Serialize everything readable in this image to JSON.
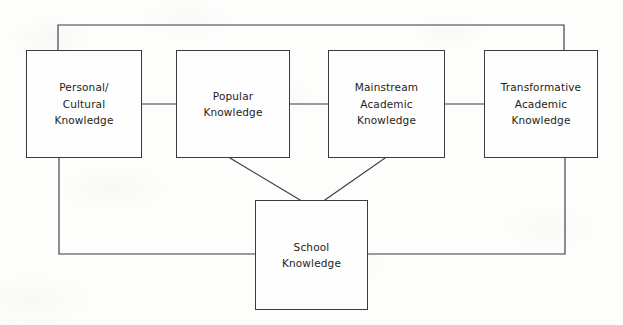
{
  "diagram": {
    "background_color": "#fdfdfc",
    "line_color": "#3b3b40",
    "text_color": "#1d1d20",
    "nodes": [
      {
        "id": "personal-cultural-knowledge",
        "lines": [
          "Personal/",
          "Cultural",
          "Knowledge"
        ],
        "x": 26,
        "y": 50,
        "width": 116,
        "height": 108
      },
      {
        "id": "popular-knowledge",
        "lines": [
          "Popular",
          "Knowledge"
        ],
        "x": 176,
        "y": 50,
        "width": 114,
        "height": 108
      },
      {
        "id": "mainstream-academic-knowledge",
        "lines": [
          "Mainstream",
          "Academic",
          "Knowledge"
        ],
        "x": 328,
        "y": 50,
        "width": 117,
        "height": 108
      },
      {
        "id": "transformative-academic-knowledge",
        "lines": [
          "Transformative",
          "Academic",
          "Knowledge"
        ],
        "x": 484,
        "y": 50,
        "width": 114,
        "height": 108
      },
      {
        "id": "school-knowledge",
        "lines": [
          "School",
          "Knowledge"
        ],
        "x": 255,
        "y": 200,
        "width": 113,
        "height": 110
      }
    ],
    "connectors": [
      {
        "id": "personal-to-popular-link",
        "type": "straight-horizontal",
        "points": "142,104 176,104"
      },
      {
        "id": "popular-to-mainstream-link",
        "type": "straight-horizontal",
        "points": "290,104 328,104"
      },
      {
        "id": "mainstream-to-transformative-link",
        "type": "straight-horizontal",
        "points": "445,104 484,104"
      },
      {
        "id": "popular-to-school-diagonal",
        "type": "diagonal",
        "points": "230,158 300,200"
      },
      {
        "id": "mainstream-to-school-diagonal",
        "type": "diagonal",
        "points": "385,158 325,200"
      },
      {
        "id": "personal-to-transformative-top-bracket",
        "type": "orthogonal",
        "points": "58,50 58,25 564,25 564,50"
      },
      {
        "id": "personal-to-school-bottom-left-bracket",
        "type": "orthogonal",
        "points": "59,158 59,254 255,254"
      },
      {
        "id": "transformative-to-school-bottom-right-bracket",
        "type": "orthogonal",
        "points": "565,158 565,254 368,254"
      }
    ]
  }
}
